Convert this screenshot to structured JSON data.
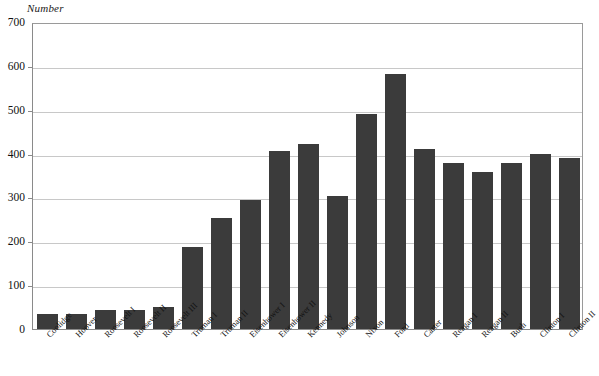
{
  "chart_data": {
    "type": "bar",
    "title": "",
    "subtitle": "",
    "xlabel": "",
    "ylabel": "Number",
    "ylim": [
      0,
      700
    ],
    "yticks": [
      0,
      100,
      200,
      300,
      400,
      500,
      600,
      700
    ],
    "grid": true,
    "legend": null,
    "bar_color": "#3b3b3b",
    "categories": [
      "Coolidge",
      "Hoover",
      "Roosevelt I",
      "Roosevelt II",
      "Roosevelt III",
      "Truman I",
      "Truman II",
      "Eisenhower I",
      "Eisenhower II",
      "Kennedy",
      "Johnson",
      "Nixon",
      "Ford",
      "Carter",
      "Reagan I",
      "Reagan II",
      "Bush",
      "Clinton I",
      "Clinton II"
    ],
    "values": [
      34,
      35,
      44,
      44,
      51,
      188,
      254,
      295,
      405,
      421,
      303,
      490,
      582,
      410,
      378,
      359,
      378,
      398,
      391
    ]
  }
}
